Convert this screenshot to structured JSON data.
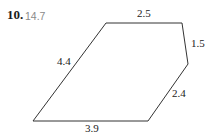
{
  "problem": {
    "number": "10.",
    "answer": "14.7"
  },
  "figure": {
    "shape": "pentagon",
    "stroke_color": "#333333",
    "vertices": [
      [
        106,
        23
      ],
      [
        182,
        23
      ],
      [
        188,
        64
      ],
      [
        148,
        121
      ],
      [
        33,
        121
      ]
    ],
    "sides": [
      {
        "id": "top",
        "label": "2.5",
        "x": 137,
        "y": 8
      },
      {
        "id": "upper-right",
        "label": "1.5",
        "x": 191,
        "y": 38
      },
      {
        "id": "lower-right",
        "label": "2.4",
        "x": 172,
        "y": 88
      },
      {
        "id": "bottom",
        "label": "3.9",
        "x": 85,
        "y": 123
      },
      {
        "id": "left",
        "label": "4.4",
        "x": 57,
        "y": 56
      }
    ]
  }
}
